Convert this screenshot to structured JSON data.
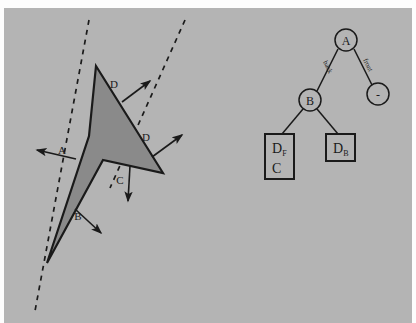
{
  "figure": {
    "background_color": "#b4b4b4",
    "page_color": "#fdfdfd",
    "polygon_fill": "#8a8a8a",
    "stroke_color": "#1a1a1a",
    "left_diagram": {
      "name": "bsp-polygon-splitting-diagram",
      "polygon": {
        "label": "concave-dart-polygon",
        "points": "92,58 159,165 99,152 43,255 85,128"
      },
      "dashed_lines": [
        {
          "name": "splitting-line-a",
          "x1": 85,
          "y1": 20,
          "x2": 35,
          "y2": 300
        },
        {
          "name": "splitting-line-b",
          "x1": 180,
          "y1": 20,
          "x2": 108,
          "y2": 180
        }
      ],
      "arrows": [
        {
          "label": "A",
          "name": "normal-arrow-a",
          "x1": 70,
          "y1": 150,
          "x2": 30,
          "y2": 141,
          "lx": 58,
          "ly": 143
        },
        {
          "label": "B",
          "name": "normal-arrow-b",
          "x1": 70,
          "y1": 200,
          "x2": 96,
          "y2": 224,
          "lx": 74,
          "ly": 210
        },
        {
          "label": "C",
          "name": "normal-arrow-c",
          "x1": 126,
          "y1": 160,
          "x2": 125,
          "y2": 192,
          "lx": 116,
          "ly": 172
        },
        {
          "label": "D",
          "name": "normal-arrow-d1",
          "x1": 117,
          "y1": 93,
          "x2": 145,
          "y2": 73,
          "lx": 110,
          "ly": 77
        },
        {
          "label": "D",
          "name": "normal-arrow-d2",
          "x1": 147,
          "y1": 148,
          "x2": 177,
          "y2": 128,
          "lx": 143,
          "ly": 130
        }
      ]
    },
    "tree_diagram": {
      "name": "bsp-tree-diagram",
      "nodes": [
        {
          "id": "A",
          "name": "tree-node-a",
          "label": "A",
          "shape": "circle",
          "cx": 342,
          "cy": 32,
          "r": 11
        },
        {
          "id": "B",
          "name": "tree-node-b",
          "label": "B",
          "shape": "circle",
          "cx": 306,
          "cy": 92,
          "r": 11
        },
        {
          "id": "minus",
          "name": "tree-node-empty",
          "label": "-",
          "shape": "circle",
          "cx": 374,
          "cy": 86,
          "r": 11
        }
      ],
      "leaves": [
        {
          "id": "DF_C",
          "name": "tree-leaf-df-c",
          "lines": [
            "D",
            "C"
          ],
          "subscript": "F",
          "x": 261,
          "y": 128,
          "w": 28,
          "h": 44
        },
        {
          "id": "DB",
          "name": "tree-leaf-db",
          "lines": [
            "D"
          ],
          "subscript": "B",
          "x": 322,
          "y": 128,
          "w": 28,
          "h": 26
        }
      ],
      "edges": [
        {
          "name": "tree-edge-a-b",
          "from": "A",
          "to": "B",
          "label": "back",
          "lx": 320,
          "ly": 58
        },
        {
          "name": "tree-edge-a-minus",
          "from": "A",
          "to": "minus",
          "label": "front",
          "lx": 364,
          "ly": 56
        },
        {
          "name": "tree-edge-b-df",
          "from": "B",
          "to": "DF_C",
          "label": "",
          "lx": 0,
          "ly": 0
        },
        {
          "name": "tree-edge-b-db",
          "from": "B",
          "to": "DB",
          "label": "",
          "lx": 0,
          "ly": 0
        }
      ]
    }
  }
}
